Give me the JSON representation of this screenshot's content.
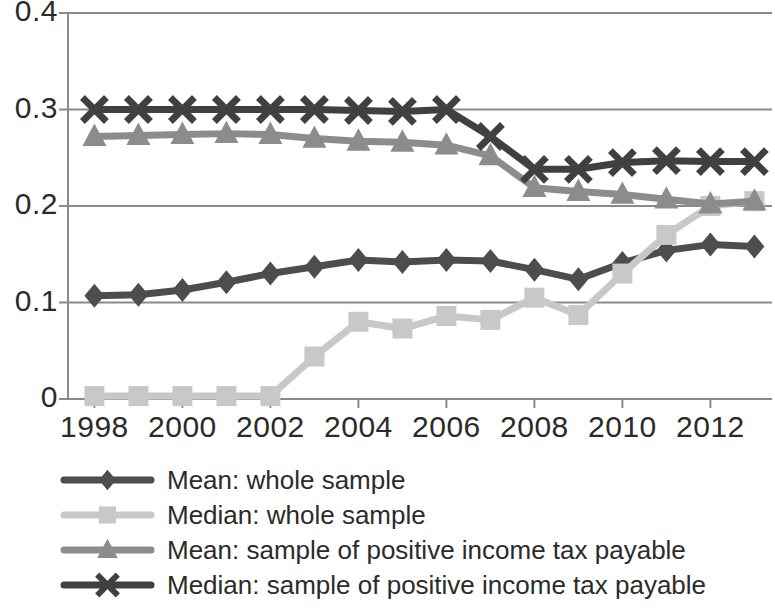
{
  "chart_data": {
    "type": "line",
    "title": "",
    "subtitle": "",
    "xlabel": "",
    "ylabel": "",
    "x": [
      1998,
      1999,
      2000,
      2001,
      2002,
      2003,
      2004,
      2005,
      2006,
      2007,
      2008,
      2009,
      2010,
      2011,
      2012,
      2013
    ],
    "xtick_labels": [
      "1998",
      "2000",
      "2002",
      "2004",
      "2006",
      "2008",
      "2010",
      "2012"
    ],
    "xtick_values": [
      1998,
      2000,
      2002,
      2004,
      2006,
      2008,
      2010,
      2012
    ],
    "ytick_labels": [
      "0",
      "0.1",
      "0.2",
      "0.3",
      "0.4"
    ],
    "ytick_values": [
      0,
      0.1,
      0.2,
      0.3,
      0.4
    ],
    "ylim": [
      0,
      0.4
    ],
    "xlim": [
      1997.4,
      2013.4
    ],
    "grid": "horizontal",
    "legend_position": "bottom-left",
    "series": [
      {
        "name": "Mean: whole sample",
        "marker": "diamond",
        "color": "#4d4d4d",
        "values": [
          0.107,
          0.108,
          0.113,
          0.121,
          0.13,
          0.137,
          0.144,
          0.142,
          0.144,
          0.143,
          0.134,
          0.124,
          0.141,
          0.154,
          0.16,
          0.158
        ]
      },
      {
        "name": "Median: whole sample",
        "marker": "square",
        "color": "#c8c8c8",
        "values": [
          0.003,
          0.003,
          0.003,
          0.003,
          0.003,
          0.044,
          0.08,
          0.073,
          0.086,
          0.082,
          0.105,
          0.087,
          0.13,
          0.17,
          0.2,
          0.205
        ]
      },
      {
        "name": "Mean: sample of positive income tax payable",
        "marker": "triangle",
        "color": "#8c8c8c",
        "values": [
          0.272,
          0.273,
          0.274,
          0.275,
          0.274,
          0.27,
          0.267,
          0.266,
          0.263,
          0.252,
          0.219,
          0.215,
          0.212,
          0.207,
          0.202,
          0.205
        ]
      },
      {
        "name": "Median: sample of positive income tax payable",
        "marker": "cross-x",
        "color": "#404040",
        "values": [
          0.3,
          0.3,
          0.3,
          0.3,
          0.3,
          0.3,
          0.299,
          0.298,
          0.3,
          0.272,
          0.238,
          0.238,
          0.245,
          0.247,
          0.246,
          0.246
        ]
      }
    ]
  },
  "axis": {
    "y_labels": [
      "0.4",
      "0.3",
      "0.2",
      "0.1",
      "0"
    ],
    "x_labels": [
      "1998",
      "2000",
      "2002",
      "2004",
      "2006",
      "2008",
      "2010",
      "2012"
    ]
  },
  "legend": {
    "items": [
      {
        "label": "Mean: whole sample",
        "marker": "diamond",
        "color": "#4d4d4d"
      },
      {
        "label": "Median: whole sample",
        "marker": "square",
        "color": "#c8c8c8"
      },
      {
        "label": "Mean: sample of positive income tax payable",
        "marker": "triangle",
        "color": "#8c8c8c"
      },
      {
        "label": "Median: sample of positive income tax payable",
        "marker": "cross-x",
        "color": "#404040"
      }
    ]
  },
  "colors": {
    "axis": "#8a8a8a",
    "grid": "#8a8a8a",
    "text": "#2b2b2b",
    "background": "#ffffff"
  }
}
